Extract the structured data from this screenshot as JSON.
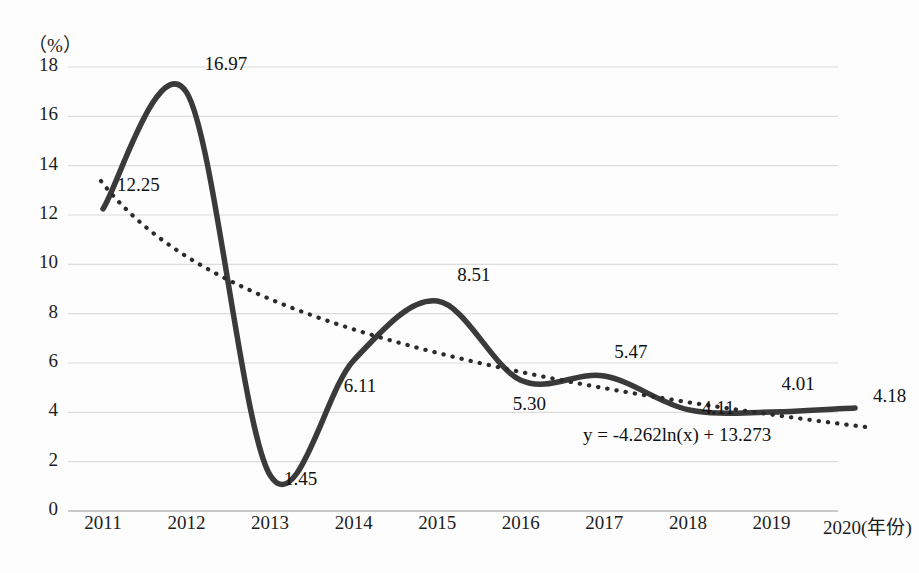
{
  "chart_data": {
    "type": "line",
    "title": "",
    "xlabel": "年份",
    "ylabel": "(%)",
    "yunit": "（%）",
    "ylim": [
      0,
      18
    ],
    "ytick_values": [
      "18",
      "16",
      "14",
      "12",
      "10",
      "8",
      "6",
      "4",
      "2",
      "0"
    ],
    "categories": [
      "2011",
      "2012",
      "2013",
      "2014",
      "2015",
      "2016",
      "2017",
      "2018",
      "2019",
      "2020"
    ],
    "xtick_labels": [
      "2011",
      "2012",
      "2013",
      "2014",
      "2015",
      "2016",
      "2017",
      "2018",
      "2019",
      "2020(年份)"
    ],
    "grid": true,
    "legend": "none",
    "series": [
      {
        "name": "数据系列",
        "style": "solid-smooth",
        "color": "#3a3a3a",
        "values": [
          12.25,
          16.97,
          1.45,
          6.11,
          8.51,
          5.3,
          5.47,
          4.11,
          4.01,
          4.18
        ]
      },
      {
        "name": "对数趋势线",
        "style": "dotted",
        "color": "#2b2b2b",
        "equation": "y = -4.262ln(x) + 13.273",
        "fit": {
          "a": -4.262,
          "b": 13.273
        },
        "values": [
          13.27,
          10.32,
          8.59,
          7.36,
          6.41,
          5.63,
          4.98,
          4.41,
          3.91,
          3.46
        ]
      }
    ],
    "data_labels": [
      {
        "text": "12.25",
        "value": 12.25,
        "year": "2011"
      },
      {
        "text": "16.97",
        "value": 16.97,
        "year": "2012"
      },
      {
        "text": "1.45",
        "value": 1.45,
        "year": "2013"
      },
      {
        "text": "6.11",
        "value": 6.11,
        "year": "2014"
      },
      {
        "text": "8.51",
        "value": 8.51,
        "year": "2015"
      },
      {
        "text": "5.30",
        "value": 5.3,
        "year": "2016"
      },
      {
        "text": "5.47",
        "value": 5.47,
        "year": "2017"
      },
      {
        "text": "4.11",
        "value": 4.11,
        "year": "2018"
      },
      {
        "text": "4.01",
        "value": 4.01,
        "year": "2019"
      },
      {
        "text": "4.18",
        "value": 4.18,
        "year": "2020"
      }
    ],
    "annotations": [
      {
        "text": "y = -4.262ln(x) + 13.273",
        "kind": "trendline-equation"
      }
    ]
  },
  "axis": {
    "unit_label": "（%）",
    "yticks": [
      "18",
      "16",
      "14",
      "12",
      "10",
      "8",
      "6",
      "4",
      "2",
      "0"
    ],
    "xticks": [
      "2011",
      "2012",
      "2013",
      "2014",
      "2015",
      "2016",
      "2017",
      "2018",
      "2019",
      "2020(年份)"
    ]
  },
  "labels": {
    "l0": "12.25",
    "l1": "16.97",
    "l2": "1.45",
    "l3": "6.11",
    "l4": "8.51",
    "l5": "5.30",
    "l6": "5.47",
    "l7": "4.11",
    "l8": "4.01",
    "l9": "4.18",
    "equation": "y = -4.262ln(x) + 13.273"
  },
  "colors": {
    "series_line": "#3a3a3a",
    "trendline": "#2b2b2b",
    "grid": "#d8d8d8",
    "text": "#111111",
    "background": "#fdfdfd"
  }
}
